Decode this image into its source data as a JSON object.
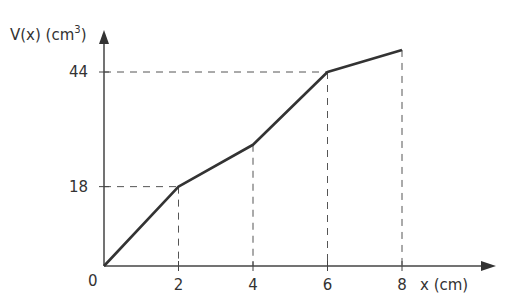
{
  "chart_data": {
    "type": "line",
    "title": "",
    "xlabel": "x (cm)",
    "ylabel": "V(x) (cm³)",
    "ylabel_parts": {
      "main": "V(x) (cm",
      "sup": "3",
      "close": ")"
    },
    "x": [
      0,
      2,
      4,
      6,
      8
    ],
    "values": [
      0,
      18,
      27.5,
      44,
      49
    ],
    "x_ticks": [
      "2",
      "4",
      "6",
      "8"
    ],
    "y_ticks": [
      "18",
      "44"
    ],
    "origin_label": "0",
    "guides": [
      {
        "x": 2,
        "y": 18,
        "horizontal": true
      },
      {
        "x": 4,
        "y": 27.5,
        "horizontal": false
      },
      {
        "x": 6,
        "y": 44,
        "horizontal": true
      },
      {
        "x": 8,
        "y": 49,
        "horizontal": false
      }
    ],
    "grid": false,
    "legend": null
  }
}
